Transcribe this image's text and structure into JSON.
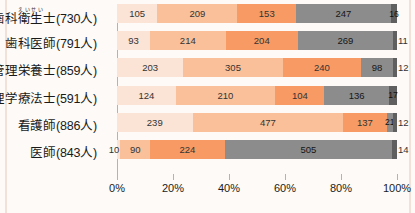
{
  "colors": {
    "background": "#fdfaf7",
    "frame": "#f0e2d8",
    "axis": "#b9b1ab",
    "s1": "#fbe3d5",
    "s2": "#f9c09a",
    "s3": "#f79a63",
    "s4": "#8c8c8c",
    "s5": "#5f5f5f",
    "label_text": "#1a1a1a"
  },
  "chart_data": {
    "type": "bar",
    "orientation": "horizontal",
    "stacked": true,
    "normalized_percent": true,
    "title": "",
    "subtitle": "",
    "xlabel": "",
    "ylabel": "",
    "grid": false,
    "legend_position": "none",
    "xlim": [
      0,
      100
    ],
    "xticks": [
      "0%",
      "20%",
      "40%",
      "60%",
      "80%",
      "100%"
    ],
    "xtick_values": [
      0,
      20,
      40,
      60,
      80,
      100
    ],
    "categories": [
      {
        "label": "歯科衛生士(730人)",
        "name": "歯科衛生士",
        "ruby_base": "衛生",
        "ruby_text": "えいせい",
        "count_text": "(730人)",
        "total": 730,
        "values": [
          105,
          209,
          153,
          247,
          16
        ]
      },
      {
        "label": "歯科医師(791人)",
        "name": "歯科医師",
        "ruby_base": "",
        "ruby_text": "",
        "count_text": "(791人)",
        "total": 791,
        "values": [
          93,
          214,
          204,
          269,
          11
        ]
      },
      {
        "label": "管理栄養士(859人)",
        "name": "管理栄養士",
        "ruby_base": "",
        "ruby_text": "",
        "count_text": "(859人)",
        "total": 859,
        "values": [
          203,
          305,
          240,
          98,
          12
        ]
      },
      {
        "label": "理学療法士(591人)",
        "name": "理学療法士",
        "ruby_base": "",
        "ruby_text": "",
        "count_text": "(591人)",
        "total": 591,
        "values": [
          124,
          210,
          104,
          136,
          17
        ]
      },
      {
        "label": "看護師(886人)",
        "name": "看護師",
        "ruby_base": "",
        "ruby_text": "",
        "count_text": "(886人)",
        "total": 886,
        "values": [
          239,
          477,
          137,
          21,
          12
        ]
      },
      {
        "label": "医師(843人)",
        "name": "医師",
        "ruby_base": "",
        "ruby_text": "",
        "count_text": "(843人)",
        "total": 843,
        "values": [
          10,
          90,
          224,
          505,
          14
        ]
      }
    ],
    "series": [
      {
        "name": "series-1",
        "color": "#fbe3d5",
        "values": [
          105,
          93,
          203,
          124,
          239,
          10
        ]
      },
      {
        "name": "series-2",
        "color": "#f9c09a",
        "values": [
          209,
          214,
          305,
          210,
          477,
          90
        ]
      },
      {
        "name": "series-3",
        "color": "#f79a63",
        "values": [
          153,
          204,
          240,
          104,
          137,
          224
        ]
      },
      {
        "name": "series-4",
        "color": "#8c8c8c",
        "values": [
          247,
          269,
          98,
          136,
          21,
          505
        ]
      },
      {
        "name": "series-5",
        "color": "#5f5f5f",
        "values": [
          16,
          11,
          12,
          17,
          12,
          14
        ]
      }
    ]
  }
}
